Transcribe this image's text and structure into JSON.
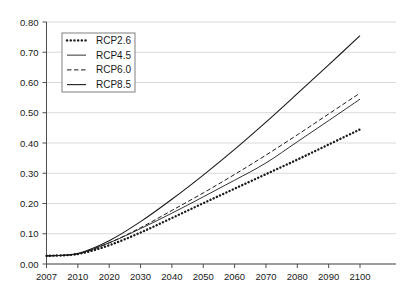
{
  "chart_data": {
    "type": "line",
    "title": "",
    "subtitle": "",
    "xlabel": "",
    "ylabel": "",
    "grid": "horizontal",
    "legend_position": "top-left",
    "xlim": [
      2007,
      2100
    ],
    "ylim": [
      0.0,
      0.8
    ],
    "x_ticks": [
      2007,
      2010,
      2020,
      2030,
      2040,
      2050,
      2060,
      2070,
      2080,
      2090,
      2100
    ],
    "x_tick_labels": [
      "2007",
      "2010",
      "2020",
      "2030",
      "2040",
      "2050",
      "2060",
      "2070",
      "2080",
      "2090",
      "2100"
    ],
    "y_ticks": [
      0.0,
      0.1,
      0.2,
      0.3,
      0.4,
      0.5,
      0.6,
      0.7,
      0.8
    ],
    "y_tick_labels": [
      "0.00",
      "0.10",
      "0.20",
      "0.30",
      "0.40",
      "0.50",
      "0.60",
      "0.70",
      "0.80"
    ],
    "x": [
      2007,
      2010,
      2020,
      2030,
      2040,
      2050,
      2060,
      2070,
      2080,
      2090,
      2100
    ],
    "series": [
      {
        "name": "RCP2.6",
        "style": "dotted",
        "color": "#1a1a1a",
        "values": [
          0.027,
          0.033,
          0.062,
          0.104,
          0.152,
          0.201,
          0.249,
          0.297,
          0.345,
          0.395,
          0.445
        ]
      },
      {
        "name": "RCP4.5",
        "style": "thin-solid",
        "color": "#1a1a1a",
        "values": [
          0.027,
          0.034,
          0.07,
          0.117,
          0.168,
          0.222,
          0.277,
          0.334,
          0.404,
          0.474,
          0.545
        ]
      },
      {
        "name": "RCP6.0",
        "style": "dashed",
        "color": "#1a1a1a",
        "values": [
          0.027,
          0.034,
          0.07,
          0.12,
          0.177,
          0.235,
          0.296,
          0.36,
          0.427,
          0.496,
          0.565
        ]
      },
      {
        "name": "RCP8.5",
        "style": "solid",
        "color": "#1a1a1a",
        "values": [
          0.027,
          0.035,
          0.077,
          0.14,
          0.214,
          0.294,
          0.379,
          0.469,
          0.563,
          0.658,
          0.755
        ]
      }
    ],
    "colors": {
      "axis": "#4d4d4d",
      "grid": "#d9d9d9",
      "line": "#1a1a1a",
      "background": "#ffffff",
      "legend_border": "#808080"
    }
  },
  "legend": {
    "entries": [
      {
        "label": "RCP2.6"
      },
      {
        "label": "RCP4.5"
      },
      {
        "label": "RCP6.0"
      },
      {
        "label": "RCP8.5"
      }
    ]
  }
}
